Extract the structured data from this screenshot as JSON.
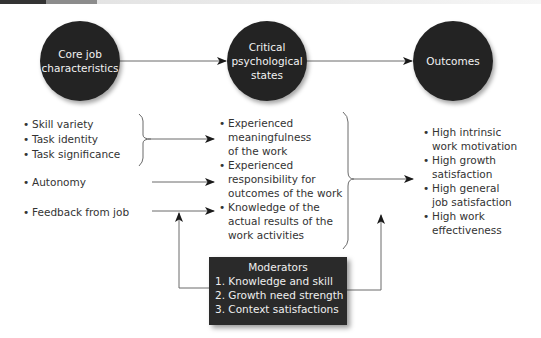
{
  "diagram": {
    "top_bar": {
      "segments": [
        "#333333",
        "#8c8c8c",
        "#e0e0e0"
      ]
    },
    "nodes": {
      "core": {
        "label": "Core job\ncharacteristics"
      },
      "states": {
        "label": "Critical\npsychological\nstates"
      },
      "outcomes": {
        "label": "Outcomes"
      }
    },
    "core_characteristics": {
      "group": [
        "Skill variety",
        "Task identity",
        "Task significance"
      ],
      "autonomy": "Autonomy",
      "feedback": "Feedback from job"
    },
    "psychological_states": [
      "Experienced\nmeaningfulness\nof the work",
      "Experienced\nresponsibility for\noutcomes of the work",
      "Knowledge of the\nactual results of the\nwork activities"
    ],
    "outcomes": [
      "High intrinsic\nwork motivation",
      "High growth\nsatisfaction",
      "High general\njob satisfaction",
      "High work\neffectiveness"
    ],
    "moderators": {
      "title": "Moderators",
      "items": [
        "1. Knowledge and skill",
        "2. Growth need strength",
        "3. Context satisfactions"
      ]
    },
    "colors": {
      "node_fill": "#232323",
      "node_text": "#f2f2f2",
      "line": "#6b6b6b",
      "arrowhead": "#1a1a1a",
      "moderator_fill": "#2a2a2a"
    }
  }
}
